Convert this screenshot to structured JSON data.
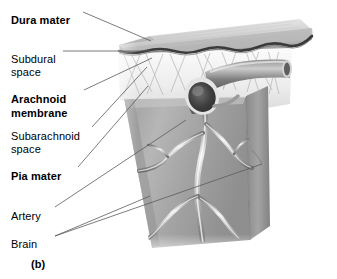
{
  "figure": {
    "caption": "(b)"
  },
  "labels": [
    {
      "id": "dura-mater",
      "text": "Dura mater",
      "bold": true,
      "x": 11,
      "y": 14
    },
    {
      "id": "subdural-space",
      "text": "Subdural",
      "bold": false,
      "x": 11,
      "y": 53
    },
    {
      "id": "subdural-space-2",
      "text": "space",
      "bold": false,
      "x": 11,
      "y": 66
    },
    {
      "id": "arachnoid-membrane",
      "text": "Arachnoid",
      "bold": true,
      "x": 11,
      "y": 93
    },
    {
      "id": "arachnoid-membrane-2",
      "text": "membrane",
      "bold": true,
      "x": 11,
      "y": 107
    },
    {
      "id": "subarachnoid-space",
      "text": "Subarachnoid",
      "bold": false,
      "x": 11,
      "y": 130
    },
    {
      "id": "subarachnoid-space-2",
      "text": "space",
      "bold": false,
      "x": 11,
      "y": 143
    },
    {
      "id": "pia-mater",
      "text": "Pia mater",
      "bold": true,
      "x": 11,
      "y": 170
    },
    {
      "id": "artery",
      "text": "Artery",
      "bold": false,
      "x": 11,
      "y": 210
    },
    {
      "id": "brain",
      "text": "Brain",
      "bold": false,
      "x": 11,
      "y": 238
    }
  ],
  "colors": {
    "background": "#ffffff",
    "text": "#000000",
    "leader_line": "#5a5a5a",
    "dura_top": "#dcdcdc",
    "dura_edge": "#9a9a9a",
    "dura_underline": "#3a3a3a",
    "brain_face": "#a8a8a8",
    "brain_side": "#8c8c8c",
    "brain_highlight": "#cfcfcf",
    "vessel_dark": "#4a4a4a",
    "vessel_light": "#d8d8d8",
    "trabecula": "#b4b4b4",
    "arachnoid_white": "#f2f2f2"
  },
  "structures": [
    {
      "name": "dura-mater-slab",
      "description": "thick gray slab forming the top plate with wavy lower margin"
    },
    {
      "name": "subdural-space-line",
      "description": "dark thin wavy line directly beneath the dura"
    },
    {
      "name": "arachnoid-membrane-sheet",
      "description": "pale membrane sheet below the subdural line"
    },
    {
      "name": "subarachnoid-trabeculae",
      "description": "fine crossing threads spanning arachnoid to pia"
    },
    {
      "name": "superior-sagittal-sinus",
      "description": "large cut vessel with dark elliptical lumen at center"
    },
    {
      "name": "brain-block",
      "description": "tapered trapezoidal block of brain tissue"
    },
    {
      "name": "cerebral-arteries",
      "description": "branching light ribbon vessels on brain surface"
    }
  ],
  "leaders": [
    {
      "id": "leader-dura-mater",
      "from": [
        83,
        12
      ],
      "to": [
        151,
        41
      ]
    },
    {
      "id": "leader-subdural-space",
      "from": [
        63,
        51
      ],
      "to": [
        150,
        51
      ]
    },
    {
      "id": "leader-arachnoid-membrane",
      "from": [
        84,
        90
      ],
      "to": [
        152,
        58
      ]
    },
    {
      "id": "leader-subarachnoid-space",
      "from": [
        92,
        127
      ],
      "to": [
        147,
        66
      ]
    },
    {
      "id": "leader-pia-mater",
      "from": [
        78,
        167
      ],
      "to": [
        148,
        84
      ]
    },
    {
      "id": "leader-artery",
      "from": [
        55,
        207
      ],
      "to": [
        185,
        120
      ]
    },
    {
      "id": "leader-brain-a",
      "from": [
        55,
        236
      ],
      "to": [
        148,
        196
      ]
    },
    {
      "id": "leader-brain-b",
      "from": [
        55,
        236
      ],
      "to": [
        260,
        165
      ]
    }
  ]
}
